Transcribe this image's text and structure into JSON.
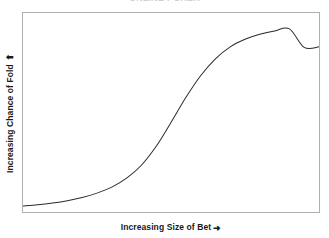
{
  "chart_data": {
    "type": "line",
    "title": "",
    "xlabel": "Increasing Size of Bet",
    "ylabel": "Increasing Chance of Fold",
    "xlabel_arrow": "➜",
    "ylabel_arrow": "⬆",
    "grid": false,
    "legend": null,
    "axis_ticks": false,
    "xlim": [
      0,
      1
    ],
    "ylim": [
      0,
      1
    ],
    "curve_color": "#2b2b2b",
    "frame_color": "#b0b0b0",
    "background_color": "#ffffff",
    "x": [
      0.0,
      0.05,
      0.1,
      0.15,
      0.2,
      0.25,
      0.3,
      0.35,
      0.4,
      0.45,
      0.5,
      0.55,
      0.6,
      0.65,
      0.7,
      0.75,
      0.8,
      0.85,
      0.9,
      0.95,
      1.0
    ],
    "y": [
      0.03,
      0.036,
      0.045,
      0.057,
      0.073,
      0.095,
      0.125,
      0.17,
      0.235,
      0.33,
      0.45,
      0.575,
      0.685,
      0.77,
      0.83,
      0.868,
      0.893,
      0.91,
      0.92,
      0.827,
      0.83
    ]
  },
  "chart_points": {
    "pixel_curve": "starts near bottom-left, inflection at mid-width, plateaus near top-right"
  },
  "title_clipped": "ONLINE POKER"
}
